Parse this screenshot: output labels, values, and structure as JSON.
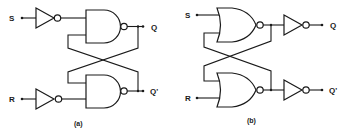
{
  "diagram": {
    "circuits": [
      {
        "caption": "(a)",
        "gate_type": "NAND",
        "inputs": {
          "top": "S",
          "bottom": "R"
        },
        "outputs": {
          "top": "Q",
          "bottom": "Q'"
        },
        "inverters": "inputs"
      },
      {
        "caption": "(b)",
        "gate_type": "NOR",
        "inputs": {
          "top": "S",
          "bottom": "R"
        },
        "outputs": {
          "top": "Q",
          "bottom": "Q'"
        },
        "inverters": "outputs"
      }
    ],
    "colors": {
      "ink": "#1a1a1a",
      "background": "#ffffff"
    }
  }
}
